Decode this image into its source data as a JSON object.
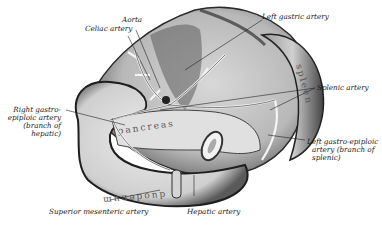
{
  "figure": {
    "organs": {
      "pancreas": "pancreas",
      "duodenum": "duodenum",
      "spleen": "spleen"
    },
    "labels": {
      "aorta": "Aorta",
      "celiac": "Celiac artery",
      "left_gastric": "Left gastric artery",
      "right_gastro_1": "Right gastro-",
      "right_gastro_2": "epiploic artery",
      "right_gastro_3": "(branch of",
      "right_gastro_4": "hepatic)",
      "splenic": "Splenic artery",
      "left_gastro_1": "Left gastro-epiploic",
      "left_gastro_2": "artery (branch of",
      "left_gastro_3": "splenic)",
      "superior_mesenteric": "Superior mesenteric artery",
      "hepatic": "Hepatic artery"
    }
  }
}
